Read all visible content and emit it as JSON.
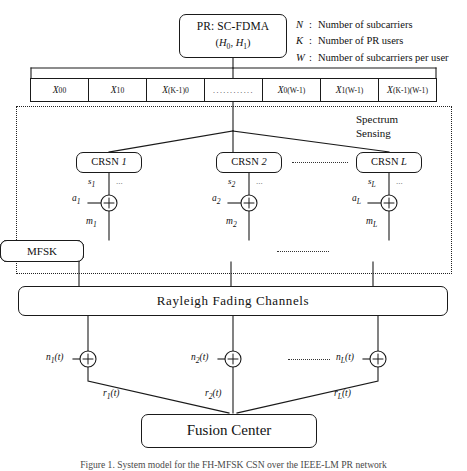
{
  "figure": {
    "caption": "Figure 1. System model for the FH-MFSK CSN over the IEEE-LM PR network"
  },
  "pr_block": {
    "title": "PR: SC-FDMA",
    "hypotheses": "(H0, H1)",
    "h0": "H",
    "h0_sub": "0",
    "h1": "H",
    "h1_sub": "1"
  },
  "legend": {
    "items": [
      {
        "symbol": "N",
        "colon": ":",
        "text": "Number of subcarriers"
      },
      {
        "symbol": "K",
        "colon": ":",
        "text": "Number of PR users"
      },
      {
        "symbol": "W",
        "colon": ":",
        "text": "Number of subcarriers per user"
      }
    ]
  },
  "subcarriers": {
    "cells": [
      {
        "base": "X",
        "sub": "00"
      },
      {
        "base": "X",
        "sub": "10"
      },
      {
        "base": "X",
        "sub": "(K-1)0"
      },
      {
        "base": "",
        "sub": ""
      },
      {
        "base": "X",
        "sub": "0(W-1)"
      },
      {
        "base": "X",
        "sub": "1(W-1)"
      },
      {
        "base": "X",
        "sub": "(K-1)(W-1)"
      }
    ],
    "ellipsis": "............"
  },
  "sensing": {
    "label_line1": "Spectrum",
    "label_line2": "Sensing"
  },
  "crsn_nodes": [
    {
      "label": "CRSN",
      "index": "1",
      "s": "s",
      "s_sub": "1",
      "a": "a",
      "a_sub": "1",
      "m": "m",
      "m_sub": "1",
      "plus": "+",
      "dots": "..."
    },
    {
      "label": "CRSN",
      "index": "2",
      "s": "s",
      "s_sub": "2",
      "a": "a",
      "a_sub": "2",
      "m": "m",
      "m_sub": "2",
      "plus": "+",
      "dots": "..."
    },
    {
      "label": "CRSN",
      "index": "L",
      "s": "s",
      "s_sub": "L",
      "a": "a",
      "a_sub": "L",
      "m": "m",
      "m_sub": "L",
      "plus": "+",
      "dots": "..."
    }
  ],
  "modulators": [
    {
      "label": "MFSK"
    },
    {
      "label": "MFSK"
    },
    {
      "label": "MFSK"
    }
  ],
  "channel": {
    "label": "Rayleigh Fading Channels"
  },
  "receivers": [
    {
      "noise": "n",
      "noise_sub": "1",
      "noise_arg": "(t)",
      "plus": "+",
      "out": "r",
      "out_sub": "1",
      "out_arg": "(t)"
    },
    {
      "noise": "n",
      "noise_sub": "2",
      "noise_arg": "(t)",
      "plus": "+",
      "out": "r",
      "out_sub": "2",
      "out_arg": "(t)"
    },
    {
      "noise": "n",
      "noise_sub": "L",
      "noise_arg": "(t)",
      "plus": "+",
      "out": "r",
      "out_sub": "L",
      "out_arg": "(t)"
    }
  ],
  "fusion": {
    "label": "Fusion Center"
  },
  "colors": {
    "line": "#1a1a1a",
    "background": "#ffffff",
    "dotted": "#222222"
  }
}
